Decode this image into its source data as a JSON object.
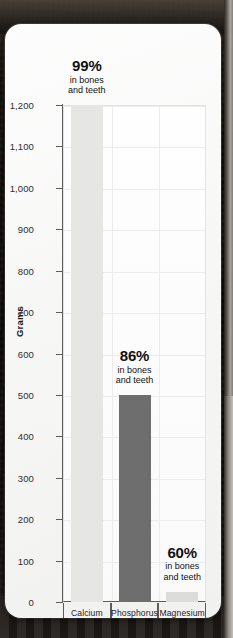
{
  "chart_data": {
    "type": "bar",
    "title": "",
    "categories": [
      "Calcium",
      "Phosphorus",
      "Magnesium"
    ],
    "values": [
      1200,
      500,
      25
    ],
    "xlabel": "Mineral",
    "ylabel": "Grams",
    "ylim": [
      0,
      1200
    ],
    "ytick_step": 100,
    "yticks": [
      0,
      100,
      200,
      300,
      400,
      500,
      600,
      700,
      800,
      900,
      1000,
      1100,
      1200
    ],
    "ytick_labels": [
      "0",
      "100",
      "200",
      "300",
      "400",
      "500",
      "600",
      "700",
      "800",
      "900",
      "1,000",
      "1,100",
      "1,200"
    ],
    "grid": true,
    "legend": "none",
    "bar_colors": [
      "#e6e6e5",
      "#6e6e6e",
      "#dcdcdb"
    ],
    "annotations": [
      {
        "series_index": 0,
        "category": "Calcium",
        "percent": "99%",
        "line1": "in bones",
        "line2": "and teeth"
      },
      {
        "series_index": 1,
        "category": "Phosphorus",
        "percent": "86%",
        "line1": "in bones",
        "line2": "and teeth"
      },
      {
        "series_index": 2,
        "category": "Magnesium",
        "percent": "60%",
        "line1": "in bones",
        "line2": "and teeth"
      }
    ]
  },
  "axes": {
    "y_title": "Grams",
    "x_title": "Mineral",
    "tick_0": "0",
    "tick_100": "100",
    "tick_200": "200",
    "tick_300": "300",
    "tick_400": "400",
    "tick_500": "500",
    "tick_600": "600",
    "tick_700": "700",
    "tick_800": "800",
    "tick_900": "900",
    "tick_1000": "1,000",
    "tick_1100": "1,100",
    "tick_1200": "1,200"
  },
  "categories": {
    "cat_0": "Calcium",
    "cat_1": "Phosphorus",
    "cat_2": "Magnesium"
  },
  "annotations": {
    "a0_pct": "99%",
    "a0_l1": "in bones",
    "a0_l2": "and teeth",
    "a1_pct": "86%",
    "a1_l1": "in bones",
    "a1_l2": "and teeth",
    "a2_pct": "60%",
    "a2_l1": "in bones",
    "a2_l2": "and teeth"
  },
  "colors": {
    "bar_calcium": "#e6e6e5",
    "bar_phosphorus": "#6e6e6e",
    "bar_magnesium": "#dcdcdb",
    "axis": "#5b5b5b",
    "grid": "#ececeb",
    "card": "#fbfbfa",
    "backdrop": "#14110f"
  }
}
